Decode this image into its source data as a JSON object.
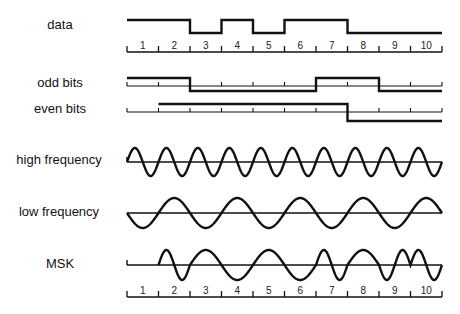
{
  "rows": {
    "data": {
      "label": "data"
    },
    "odd_bits": {
      "label": "odd bits"
    },
    "even_bits": {
      "label": "even bits"
    },
    "high_frequency": {
      "label": "high frequency"
    },
    "low_frequency": {
      "label": "low frequency"
    },
    "msk": {
      "label": "MSK"
    }
  },
  "axis": {
    "intervals": [
      "1",
      "2",
      "3",
      "4",
      "5",
      "6",
      "7",
      "8",
      "9",
      "10"
    ]
  },
  "signals": {
    "data_bits": [
      1,
      1,
      0,
      1,
      0,
      1,
      1,
      0,
      0,
      0
    ],
    "odd_bits": [
      1,
      1,
      0,
      0,
      0,
      0,
      1,
      1,
      0,
      0
    ],
    "even_bits": [
      null,
      1,
      1,
      1,
      1,
      1,
      1,
      0,
      0,
      0
    ],
    "high_frequency_cycles_per_bit": 1,
    "low_frequency_cycles_per_bit": 0.5
  },
  "colors": {
    "line": "#111111",
    "background": "#ffffff"
  }
}
